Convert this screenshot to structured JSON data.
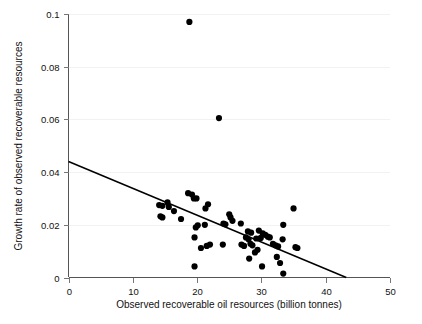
{
  "chart_data": {
    "type": "scatter",
    "title": "",
    "subtitle": "",
    "xlabel": "Observed recoverable oil resources (billion tonnes)",
    "ylabel": "Growth rate of observed recoverable resources",
    "xlim": [
      0,
      50
    ],
    "ylim": [
      0,
      0.1
    ],
    "xticks": [
      0,
      10,
      20,
      30,
      40,
      50
    ],
    "yticks": [
      0,
      0.02,
      0.04,
      0.06,
      0.08,
      0.1
    ],
    "xtick_labels": [
      "0",
      "10",
      "20",
      "30",
      "40",
      "50"
    ],
    "ytick_labels": [
      "0",
      "0.02",
      "0.04",
      "0.06",
      "0.08",
      "0.1"
    ],
    "grid": true,
    "grid_axis": "y",
    "legend": false,
    "legend_position": "none",
    "marker": "circle",
    "marker_color": "#000000",
    "marker_radius": 3.1,
    "series": [
      {
        "name": "Observations",
        "points": [
          [
            18.8,
            0.097
          ],
          [
            23.4,
            0.0605
          ],
          [
            18.6,
            0.032
          ],
          [
            19.2,
            0.0315
          ],
          [
            19.5,
            0.03
          ],
          [
            19.9,
            0.03
          ],
          [
            14.1,
            0.0275
          ],
          [
            14.6,
            0.0272
          ],
          [
            15.4,
            0.0285
          ],
          [
            15.6,
            0.0268
          ],
          [
            21.7,
            0.0278
          ],
          [
            21.3,
            0.0262
          ],
          [
            35.0,
            0.0262
          ],
          [
            14.3,
            0.0232
          ],
          [
            14.6,
            0.0228
          ],
          [
            16.4,
            0.0252
          ],
          [
            17.5,
            0.0222
          ],
          [
            25.0,
            0.024
          ],
          [
            25.2,
            0.0228
          ],
          [
            25.5,
            0.0215
          ],
          [
            24.1,
            0.0205
          ],
          [
            24.4,
            0.0202
          ],
          [
            26.8,
            0.0205
          ],
          [
            20.1,
            0.0198
          ],
          [
            21.2,
            0.02
          ],
          [
            33.4,
            0.02
          ],
          [
            19.8,
            0.019
          ],
          [
            27.9,
            0.0175
          ],
          [
            28.4,
            0.017
          ],
          [
            29.6,
            0.0178
          ],
          [
            30.2,
            0.0168
          ],
          [
            30.6,
            0.0162
          ],
          [
            31.0,
            0.0155
          ],
          [
            29.2,
            0.0148
          ],
          [
            29.9,
            0.015
          ],
          [
            31.3,
            0.0152
          ],
          [
            27.6,
            0.0152
          ],
          [
            28.0,
            0.0145
          ],
          [
            33.3,
            0.0145
          ],
          [
            19.6,
            0.0152
          ],
          [
            28.3,
            0.0128
          ],
          [
            28.6,
            0.0122
          ],
          [
            26.9,
            0.0125
          ],
          [
            27.3,
            0.012
          ],
          [
            24.0,
            0.0125
          ],
          [
            22.0,
            0.0125
          ],
          [
            21.5,
            0.012
          ],
          [
            20.6,
            0.0112
          ],
          [
            31.8,
            0.0128
          ],
          [
            32.2,
            0.0122
          ],
          [
            32.6,
            0.0118
          ],
          [
            35.3,
            0.0115
          ],
          [
            35.6,
            0.0112
          ],
          [
            29.4,
            0.0105
          ],
          [
            29.0,
            0.0095
          ],
          [
            28.1,
            0.0072
          ],
          [
            32.4,
            0.0078
          ],
          [
            32.9,
            0.0055
          ],
          [
            30.1,
            0.0042
          ],
          [
            19.6,
            0.0042
          ],
          [
            33.4,
            0.0015
          ]
        ]
      }
    ],
    "trend_line": {
      "name": "Fitted regression line",
      "x_start": 0,
      "y_start": 0.044,
      "x_end": 43.2,
      "y_end": 0.0
    }
  }
}
